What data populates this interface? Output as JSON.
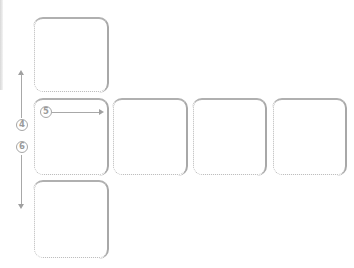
{
  "diagram": {
    "colors": {
      "tile_border": "#b8b8b8",
      "tile_shadow": "#a8a8a8",
      "arrow": "#a0a0a0",
      "badge_text": "#9a9a9a",
      "background": "#ffffff"
    },
    "tiles": [
      {
        "id": "top",
        "row": 0,
        "col": 0
      },
      {
        "id": "middle-1",
        "row": 1,
        "col": 0
      },
      {
        "id": "middle-2",
        "row": 1,
        "col": 1
      },
      {
        "id": "middle-3",
        "row": 1,
        "col": 2
      },
      {
        "id": "middle-4",
        "row": 1,
        "col": 3
      },
      {
        "id": "bottom",
        "row": 2,
        "col": 0
      }
    ],
    "markers": {
      "step4": "4",
      "step5": "5",
      "step6": "6"
    },
    "arrows": {
      "vertical": "bidirectional up/down along left side (steps 4 and 6)",
      "horizontal": "right-pointing from step 5 marker"
    }
  }
}
